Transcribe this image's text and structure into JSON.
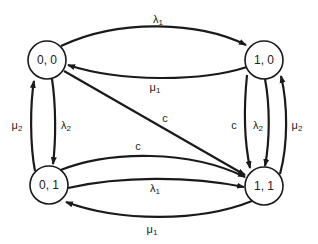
{
  "diagram": {
    "type": "state-transition",
    "nodes": [
      {
        "id": "n00",
        "label": "0, 0",
        "cx": 47,
        "cy": 60
      },
      {
        "id": "n10",
        "label": "1, 0",
        "cx": 264,
        "cy": 60
      },
      {
        "id": "n01",
        "label": "0, 1",
        "cx": 49,
        "cy": 185
      },
      {
        "id": "n11",
        "label": "1, 1",
        "cx": 264,
        "cy": 186
      }
    ],
    "edges": [
      {
        "from": "0, 0",
        "to": "1, 0",
        "symbol": "λ",
        "sub": "1"
      },
      {
        "from": "1, 0",
        "to": "0, 0",
        "symbol": "μ",
        "sub": "1"
      },
      {
        "from": "0, 0",
        "to": "1, 1",
        "symbol": "c",
        "sub": ""
      },
      {
        "from": "0, 0",
        "to": "0, 1",
        "symbol": "λ",
        "sub": "2"
      },
      {
        "from": "0, 1",
        "to": "0, 0",
        "symbol": "μ",
        "sub": "2"
      },
      {
        "from": "0, 1",
        "to": "1, 1",
        "symbol": "c",
        "sub": ""
      },
      {
        "from": "0, 1",
        "to": "1, 1",
        "symbol": "λ",
        "sub": "1"
      },
      {
        "from": "1, 1",
        "to": "0, 1",
        "symbol": "μ",
        "sub": "1"
      },
      {
        "from": "1, 0",
        "to": "1, 1",
        "symbol": "c",
        "sub": ""
      },
      {
        "from": "1, 0",
        "to": "1, 1",
        "symbol": "λ",
        "sub": "2"
      },
      {
        "from": "1, 1",
        "to": "1, 0",
        "symbol": "μ",
        "sub": "2"
      }
    ]
  }
}
